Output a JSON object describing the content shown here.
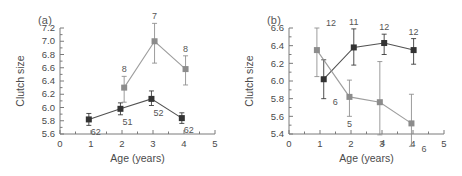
{
  "figure": {
    "panels": [
      {
        "id": "a",
        "label": "(a)",
        "axis": {
          "xlabel": "Age (years)",
          "ylabel": "Clutch size",
          "xlim": [
            0,
            5
          ],
          "ylim": [
            5.6,
            7.2
          ],
          "xticks": [
            "0",
            "1",
            "2",
            "3",
            "4",
            "5"
          ],
          "yticks": [
            "5.6",
            "5.8",
            "6.0",
            "6.2",
            "6.4",
            "6.6",
            "6.8",
            "7.0",
            "7.2"
          ],
          "xminor": 0.5,
          "yminor": 0.1
        },
        "chart_data": {
          "type": "line",
          "title": "(a)",
          "xlabel": "Age (years)",
          "ylabel": "Clutch size",
          "xlim": [
            0,
            5
          ],
          "ylim": [
            5.6,
            7.2
          ],
          "grid": false,
          "legend": "none",
          "series": [
            {
              "name": "dark-series",
              "color": "#333333",
              "x": [
                0.93,
                1.95,
                2.95,
                3.93
              ],
              "values": [
                5.82,
                5.98,
                6.13,
                5.84
              ],
              "yerr_low": [
                0.09,
                0.09,
                0.1,
                0.08
              ],
              "yerr_high": [
                0.09,
                0.09,
                0.12,
                0.08
              ],
              "point_labels": [
                "62",
                "51",
                "52",
                "62"
              ],
              "label_position": "below"
            },
            {
              "name": "gray-series",
              "color": "#8c8c8c",
              "x": [
                2.07,
                3.05,
                4.05
              ],
              "values": [
                6.3,
                7.0,
                6.58
              ],
              "yerr_low": [
                0.22,
                0.33,
                0.24
              ],
              "yerr_high": [
                0.17,
                0.27,
                0.2
              ],
              "point_labels": [
                "8",
                "7",
                "8"
              ],
              "label_position": "above"
            }
          ]
        }
      },
      {
        "id": "b",
        "label": "(b)",
        "axis": {
          "xlabel": "Age (years)",
          "ylabel": "Clutch size",
          "xlim": [
            0,
            5
          ],
          "ylim": [
            5.4,
            6.6
          ],
          "xticks": [
            "0",
            "1",
            "2",
            "3",
            "4",
            "5"
          ],
          "yticks": [
            "5.4",
            "5.6",
            "5.8",
            "6.0",
            "6.2",
            "6.4",
            "6.6"
          ],
          "xminor": 0.5,
          "yminor": 0.1
        },
        "chart_data": {
          "type": "line",
          "title": "(b)",
          "xlabel": "Age (years)",
          "ylabel": "Clutch size",
          "xlim": [
            0,
            5
          ],
          "ylim": [
            5.4,
            6.6
          ],
          "grid": false,
          "legend": "none",
          "series": [
            {
              "name": "dark-series",
              "color": "#333333",
              "x": [
                1.12,
                2.09,
                3.07,
                4.02
              ],
              "values": [
                6.02,
                6.38,
                6.43,
                6.35
              ],
              "yerr_low": [
                0.22,
                0.2,
                0.13,
                0.16
              ],
              "yerr_high": [
                0.22,
                0.21,
                0.1,
                0.13
              ],
              "point_labels": [
                "6",
                "11",
                "12",
                "12"
              ],
              "label_position": "mixed"
            },
            {
              "name": "gray-series",
              "color": "#8c8c8c",
              "x": [
                0.9,
                1.95,
                2.93,
                3.95
              ],
              "values": [
                6.35,
                5.82,
                5.76,
                5.52
              ],
              "yerr_low": [
                0.3,
                0.22,
                0.37,
                0.26
              ],
              "yerr_high": [
                0.25,
                0.19,
                0.46,
                0.33
              ],
              "point_labels": [
                "12",
                "5",
                "4",
                "6"
              ],
              "label_position": "mixed"
            }
          ]
        }
      }
    ]
  },
  "style": {
    "dark_color": "#333333",
    "gray_color": "#8c8c8c",
    "axis_color": "#7a7a7a",
    "text_color": "#4a4a4a",
    "background": "#ffffff"
  }
}
